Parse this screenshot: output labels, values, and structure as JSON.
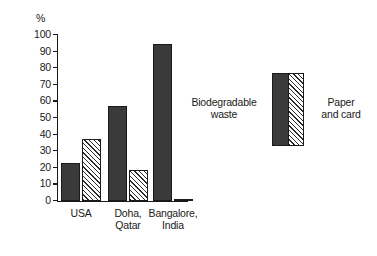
{
  "chart_data": {
    "type": "bar",
    "title": "",
    "subtitle": "",
    "xlabel": "",
    "ylabel": "%",
    "ylim": [
      0,
      100
    ],
    "y_tick_step": 10,
    "y_ticks": [
      "0",
      "10",
      "20",
      "30",
      "40",
      "50",
      "60",
      "70",
      "80",
      "90",
      "100"
    ],
    "grid": false,
    "categories": [
      "USA",
      "Doha,\nQatar",
      "Bangalore,\nIndia"
    ],
    "series": [
      {
        "name": "Biodegradable waste",
        "fill": "solid",
        "color": "#3a3a3a",
        "values": [
          23,
          57,
          94.5
        ]
      },
      {
        "name": "Paper and card",
        "fill": "diagonal-hatch",
        "color": "#ffffff",
        "values": [
          37.5,
          18.5,
          1
        ]
      }
    ],
    "legend_position": "right",
    "annotations": []
  },
  "axis": {
    "unit_label": "%"
  },
  "legend": {
    "left_label": "Biodegradable\nwaste",
    "right_label": "Paper\nand card"
  }
}
